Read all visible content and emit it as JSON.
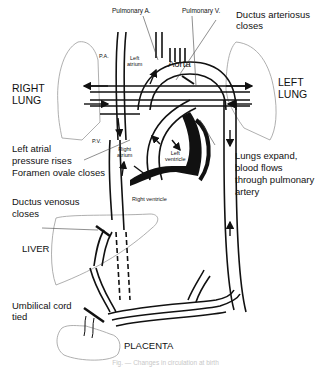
{
  "diagram": {
    "labels": {
      "pulmonary_artery_top": "Pulmonary A.",
      "pulmonary_vein_top": "Pulmonary V.",
      "ductus_arteriosus": "Ductus arteriosus\ncloses",
      "pa": "P.A.",
      "left_atrium": "Left\natrium",
      "aorta": "Aorta",
      "right_lung": "RIGHT\nLUNG",
      "left_lung": "LEFT\nLUNG",
      "pv": "P.V.",
      "right_atrium": "Right\natrium",
      "left_ventricle": "Left\nventricle",
      "right_ventricle": "Right ventricle",
      "left_atrial_pressure": "Left atrial\npressure rises\nForamen ovale closes",
      "lungs_expand": "Lungs expand,\nblood flows\nthrough pulmonary\nartery",
      "ductus_venosus": "Ductus venosus\ncloses",
      "liver": "LIVER",
      "umbilical_cord": "Umbilical cord\ntied",
      "placenta": "PLACENTA"
    },
    "caption": "Fig. — Changes in circulation at birth"
  },
  "colors": {
    "line": "#111111",
    "organ_outline": "#9a9a9a",
    "caption": "#c8c8c8"
  }
}
